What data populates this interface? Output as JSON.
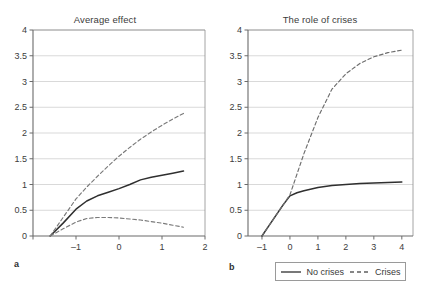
{
  "figure": {
    "panels": [
      {
        "key": "a",
        "label": "a",
        "title": "Average effect"
      },
      {
        "key": "b",
        "label": "b",
        "title": "The role of crises"
      }
    ]
  },
  "legend": {
    "entries": [
      {
        "label": "No crises",
        "style": "solid",
        "color": "#2f2f2f"
      },
      {
        "label": "Crises",
        "style": "dashed",
        "color": "#6e6e6e"
      }
    ]
  },
  "axis_labels": {
    "y": [
      "0",
      "0.5",
      "1",
      "1.5",
      "2",
      "2.5",
      "3",
      "3.5",
      "4"
    ],
    "x_a": [
      "",
      "-1",
      "0",
      "1",
      "2"
    ],
    "x_b": [
      "-1",
      "0",
      "1",
      "2",
      "3",
      "4"
    ]
  },
  "chart_data": [
    {
      "type": "line",
      "title": "Average effect",
      "panel": "a",
      "xlabel": "",
      "ylabel": "",
      "xlim": [
        -2,
        2
      ],
      "ylim": [
        0,
        4
      ],
      "xticks": [
        -2,
        -1,
        0,
        1,
        2
      ],
      "xticklabels": [
        "",
        "-1",
        "0",
        "1",
        "2"
      ],
      "yticks": [
        0,
        0.5,
        1,
        1.5,
        2,
        2.5,
        3,
        3.5,
        4
      ],
      "yticklabels": [
        "0",
        "0.5",
        "1",
        "1.5",
        "2",
        "2.5",
        "3",
        "3.5",
        "4"
      ],
      "grid": "horizontal",
      "legend": "none",
      "series": [
        {
          "name": "Point estimate",
          "style": "solid",
          "color": "#2f2f2f",
          "x": [
            -1.6,
            -1.3,
            -1.0,
            -0.75,
            -0.5,
            -0.25,
            0.0,
            0.25,
            0.5,
            0.75,
            1.0,
            1.25,
            1.5
          ],
          "y": [
            0.0,
            0.25,
            0.52,
            0.68,
            0.78,
            0.85,
            0.92,
            1.0,
            1.09,
            1.14,
            1.18,
            1.22,
            1.26
          ]
        },
        {
          "name": "Upper confidence band",
          "style": "dashed",
          "color": "#7a7a7a",
          "x": [
            -1.6,
            -1.3,
            -1.0,
            -0.75,
            -0.5,
            -0.25,
            0.0,
            0.25,
            0.5,
            0.75,
            1.0,
            1.25,
            1.5
          ],
          "y": [
            0.0,
            0.36,
            0.72,
            0.95,
            1.16,
            1.36,
            1.55,
            1.72,
            1.88,
            2.02,
            2.15,
            2.27,
            2.38
          ]
        },
        {
          "name": "Lower confidence band",
          "style": "dashed",
          "color": "#7a7a7a",
          "x": [
            -1.6,
            -1.3,
            -1.0,
            -0.75,
            -0.5,
            -0.25,
            0.0,
            0.25,
            0.5,
            0.75,
            1.0,
            1.25,
            1.5
          ],
          "y": [
            0.0,
            0.14,
            0.27,
            0.34,
            0.36,
            0.36,
            0.35,
            0.33,
            0.31,
            0.28,
            0.25,
            0.21,
            0.17
          ]
        }
      ]
    },
    {
      "type": "line",
      "title": "The role of crises",
      "panel": "b",
      "xlabel": "",
      "ylabel": "",
      "xlim": [
        -1.5,
        4.4
      ],
      "ylim": [
        0,
        4
      ],
      "xticks": [
        -1,
        0,
        1,
        2,
        3,
        4
      ],
      "xticklabels": [
        "-1",
        "0",
        "1",
        "2",
        "3",
        "4"
      ],
      "yticks": [
        0,
        0.5,
        1,
        1.5,
        2,
        2.5,
        3,
        3.5,
        4
      ],
      "yticklabels": [
        "0",
        "0.5",
        "1",
        "1.5",
        "2",
        "2.5",
        "3",
        "3.5",
        "4"
      ],
      "grid": "horizontal",
      "legend": "below",
      "series": [
        {
          "name": "No crises",
          "style": "solid",
          "color": "#2f2f2f",
          "x": [
            -1.0,
            -0.75,
            -0.5,
            -0.25,
            0.0,
            0.25,
            0.5,
            1.0,
            1.5,
            2.0,
            2.5,
            3.0,
            3.5,
            4.0
          ],
          "y": [
            0.0,
            0.2,
            0.4,
            0.6,
            0.78,
            0.84,
            0.88,
            0.94,
            0.98,
            1.0,
            1.02,
            1.03,
            1.04,
            1.05
          ]
        },
        {
          "name": "Crises",
          "style": "dashed",
          "color": "#6e6e6e",
          "x": [
            -1.0,
            -0.75,
            -0.5,
            -0.25,
            0.0,
            0.5,
            1.0,
            1.5,
            2.0,
            2.5,
            3.0,
            3.5,
            4.0
          ],
          "y": [
            0.0,
            0.2,
            0.4,
            0.6,
            0.8,
            1.6,
            2.3,
            2.85,
            3.15,
            3.35,
            3.48,
            3.56,
            3.61
          ]
        }
      ]
    }
  ]
}
